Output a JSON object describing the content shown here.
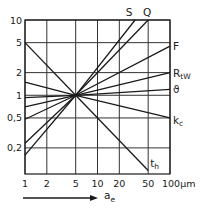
{
  "chart_data": {
    "type": "line",
    "title": "",
    "xlabel": "a_e",
    "xlabel_main": "a",
    "xlabel_sub": "e",
    "x_unit": "µm",
    "ylabel": "",
    "xscale": "log",
    "yscale": "log",
    "xlim": [
      1,
      100
    ],
    "ylim": [
      0.09,
      10
    ],
    "grid": true,
    "legend_position": "inline-at-line-ends",
    "x_ticks": [
      1,
      2,
      5,
      10,
      20,
      50,
      100
    ],
    "x_tick_labels": [
      "1",
      "2",
      "5",
      "10",
      "20",
      "50",
      "100µm"
    ],
    "y_ticks": [
      10,
      5,
      2,
      1,
      0.5,
      0.2
    ],
    "y_tick_labels": [
      "10",
      "5",
      "2",
      "1",
      "0,5",
      "0,2"
    ],
    "series": [
      {
        "name": "S",
        "x": [
          1,
          5,
          33
        ],
        "values": [
          0.16,
          1,
          10
        ]
      },
      {
        "name": "Q",
        "x": [
          1,
          5,
          50
        ],
        "values": [
          0.23,
          1,
          10
        ]
      },
      {
        "name": "F",
        "x": [
          1,
          5,
          100
        ],
        "values": [
          0.48,
          1,
          4.5
        ]
      },
      {
        "name": "RtW",
        "label_main": "R",
        "label_sub": "tW",
        "x": [
          1,
          5,
          100
        ],
        "values": [
          0.7,
          1,
          2
        ]
      },
      {
        "name": "ϑ",
        "x": [
          1,
          5,
          100
        ],
        "values": [
          0.93,
          1,
          1.2
        ]
      },
      {
        "name": "kc",
        "label_main": "k",
        "label_sub": "c",
        "x": [
          1,
          5,
          100
        ],
        "values": [
          1.5,
          1,
          0.5
        ]
      },
      {
        "name": "th",
        "label_main": "t",
        "label_sub": "h",
        "x": [
          1,
          5,
          50
        ],
        "values": [
          5,
          1,
          0.1
        ]
      }
    ],
    "annotations": [
      "arrow indicating increasing a_e along x-axis"
    ]
  }
}
